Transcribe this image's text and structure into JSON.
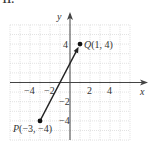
{
  "figure_label": "11.",
  "chart_data": {
    "type": "line",
    "title": "",
    "xlabel": "x",
    "ylabel": "y",
    "xlim": [
      -6,
      6
    ],
    "ylim": [
      -6,
      6
    ],
    "grid": true,
    "x_ticks": [
      "-4",
      "-2",
      "2",
      "4"
    ],
    "y_ticks": [
      "4",
      "-2",
      "-4"
    ],
    "points": [
      {
        "name": "P",
        "x": -3,
        "y": -4,
        "label": "P(−3, −4)"
      },
      {
        "name": "Q",
        "x": 1,
        "y": 4,
        "label": "Q(1, 4)"
      }
    ],
    "segments": [
      {
        "from": "P",
        "to": "Q",
        "arrow": true
      }
    ]
  },
  "axes": {
    "x_label": "x",
    "y_label": "y"
  }
}
